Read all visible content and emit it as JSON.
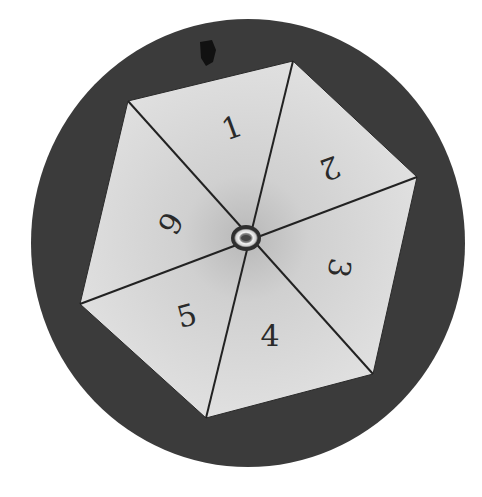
{
  "spinner": {
    "background_color": "#ffffff",
    "disc": {
      "cx": 248,
      "cy": 243,
      "rx": 217,
      "ry": 224,
      "color": "#3b3b3b"
    },
    "hexagon": {
      "fill": "#dddddd",
      "center_shade": "#bcbcbc",
      "stroke": "#2a2a2a",
      "center": [
        246,
        238
      ],
      "vertices": [
        [
          128,
          101
        ],
        [
          293,
          61
        ],
        [
          417,
          177
        ],
        [
          373,
          374
        ],
        [
          206,
          418
        ],
        [
          80,
          304
        ]
      ]
    },
    "sectors": [
      {
        "label": "1",
        "x": 232,
        "y": 128,
        "rotate": -20
      },
      {
        "label": "2",
        "x": 330,
        "y": 168,
        "rotate": 160
      },
      {
        "label": "3",
        "x": 339,
        "y": 268,
        "rotate": 100
      },
      {
        "label": "4",
        "x": 270,
        "y": 336,
        "rotate": 0
      },
      {
        "label": "5",
        "x": 187,
        "y": 316,
        "rotate": -15
      },
      {
        "label": "6",
        "x": 170,
        "y": 223,
        "rotate": 120
      }
    ],
    "hub": {
      "cx": 246,
      "cy": 238,
      "rx": 12,
      "ry": 10
    },
    "mark": {
      "cx": 207,
      "cy": 52
    }
  }
}
